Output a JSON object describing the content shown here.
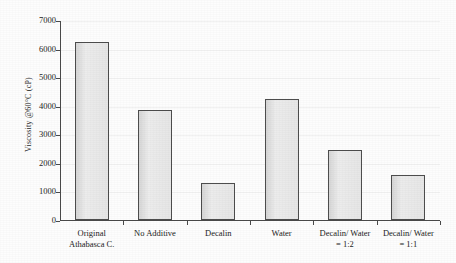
{
  "chart_data": {
    "type": "bar",
    "title": "",
    "xlabel": "",
    "ylabel": "Viscosity @60°C (cP)",
    "categories": [
      "Original Athabasca C.",
      "No Additive",
      "Decalin",
      "Water",
      "Decalin/ Water = 1:2",
      "Decalin/ Water = 1:1"
    ],
    "category_lines": [
      [
        "Original",
        "Athabasca C."
      ],
      [
        "No Additive",
        ""
      ],
      [
        "Decalin",
        ""
      ],
      [
        "Water",
        ""
      ],
      [
        "Decalin/ Water",
        "= 1:2"
      ],
      [
        "Decalin/ Water",
        "= 1:1"
      ]
    ],
    "values": [
      6230,
      3850,
      1300,
      4240,
      2450,
      1560
    ],
    "ylim": [
      0,
      7000
    ],
    "ytick_labels": [
      "0",
      "1000",
      "2000",
      "3000",
      "4000",
      "5000",
      "6000",
      "7000"
    ],
    "ytick_values": [
      0,
      1000,
      2000,
      3000,
      4000,
      5000,
      6000,
      7000
    ],
    "grid": false,
    "legend": "none",
    "bar_fill_color": "#e2e2e2",
    "bar_border_color": "#4d4d4d",
    "axis_color": "#4a4a4a"
  }
}
